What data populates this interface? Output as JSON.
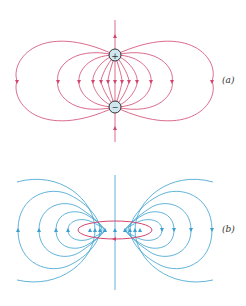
{
  "panels": [
    {
      "id": "a",
      "label": "(a)",
      "title": "Electric dipole field lines",
      "color": "#d2456e",
      "charges": [
        {
          "sign": "+",
          "symbol": "+"
        },
        {
          "sign": "-",
          "symbol": "−"
        }
      ]
    },
    {
      "id": "b",
      "label": "(b)",
      "title": "Magnetic field of current loop",
      "color": "#3a9fcf",
      "loop_color": "#d2456e"
    }
  ]
}
